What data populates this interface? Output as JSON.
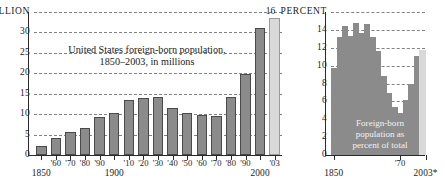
{
  "chart_data": [
    {
      "id": "foreign-born-millions",
      "type": "bar",
      "title": "United States foreign-born population,\n1850–2003, in millions",
      "title_line1": "United States foreign-born population,",
      "title_line2": "1850–2003, in millions",
      "unit_label": "MILLION",
      "xlabel": "",
      "ylabel": "",
      "ylim": [
        0,
        35
      ],
      "yticks": [
        0,
        5,
        10,
        15,
        20,
        25,
        30,
        35
      ],
      "ytick_labels": [
        "0",
        "5",
        "10",
        "15",
        "20",
        "25",
        "30",
        "35"
      ],
      "grid": true,
      "legend": "none",
      "categories": [
        "1850",
        "'60",
        "'70",
        "'80",
        "'90",
        "1900",
        "'10",
        "'20",
        "'30",
        "'40",
        "'50",
        "'60",
        "'70",
        "'80",
        "'90",
        "2000",
        "'03"
      ],
      "values": [
        2.2,
        4.1,
        5.6,
        6.7,
        9.2,
        10.3,
        13.5,
        13.9,
        14.2,
        11.6,
        10.3,
        9.7,
        9.6,
        14.1,
        19.8,
        31.1,
        33.5
      ],
      "highlight_index": 16,
      "axis_labels_major": [
        "1850",
        "1900",
        "2000"
      ],
      "bar_color": "#8b8b8b",
      "highlight_color": "#d9d9d9"
    },
    {
      "id": "foreign-born-percent",
      "type": "area",
      "title": "Foreign-born\npopulation as\npercent of total",
      "title_line1": "Foreign-born",
      "title_line2": "population as",
      "title_line3": "percent of total",
      "unit_label": "PERCENT",
      "xlabel": "",
      "ylabel": "",
      "ylim": [
        0,
        16
      ],
      "yticks": [
        0,
        2,
        4,
        6,
        8,
        10,
        12,
        14,
        16
      ],
      "ytick_labels": [
        "0",
        "2",
        "4",
        "6",
        "8",
        "10",
        "12",
        "14",
        "16"
      ],
      "grid": true,
      "legend": "none",
      "categories": [
        "1850",
        "1860",
        "1870",
        "1880",
        "1890",
        "1900",
        "1910",
        "1920",
        "1930",
        "1940",
        "1950",
        "1960",
        "1970",
        "1980",
        "1990",
        "2000",
        "2003"
      ],
      "values": [
        9.7,
        13.2,
        14.4,
        13.3,
        14.8,
        13.6,
        14.7,
        13.2,
        11.6,
        8.8,
        6.9,
        5.4,
        4.7,
        6.2,
        7.9,
        11.1,
        11.7
      ],
      "highlight_index": 16,
      "axis_labels_major": [
        "1850",
        "'70",
        "2003*"
      ],
      "area_color": "#8b8b8b",
      "highlight_color": "#d9d9d9"
    }
  ],
  "left_chart": {
    "unit_label": "MILLION",
    "ytick_labels": [
      "35",
      "30",
      "25",
      "20",
      "15",
      "10",
      "5",
      "0"
    ],
    "title_line1": "United States foreign-born population,",
    "title_line2": "1850–2003, in millions",
    "xtick_small": [
      "'60",
      "'70",
      "'80",
      "'90",
      "'10",
      "'20",
      "'30",
      "'40",
      "'50",
      "'60",
      "'70",
      "'80",
      "'90",
      "'03"
    ],
    "xtick_major": [
      "1850",
      "1900",
      "2000"
    ]
  },
  "right_chart": {
    "unit_label": "PERCENT",
    "ytick_labels": [
      "16",
      "14",
      "12",
      "10",
      "8",
      "6",
      "4",
      "2",
      "0"
    ],
    "anno_line1": "Foreign-born",
    "anno_line2": "population as",
    "anno_line3": "percent of total",
    "xtick_small": [
      "'70"
    ],
    "xtick_major": [
      "1850",
      "2003*"
    ]
  }
}
